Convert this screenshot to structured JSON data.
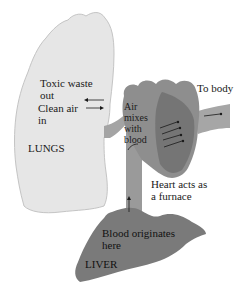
{
  "diagram": {
    "organs": {
      "lungs": {
        "label": "LUNGS",
        "fill": "#e6e6e6",
        "stroke": "#bdbdbd"
      },
      "heart": {
        "fill": "#8e8e8e",
        "shade": "#6f6f6f"
      },
      "liver": {
        "label": "LIVER",
        "fill": "#7a7a7a"
      },
      "vessels": {
        "fill": "#9a9a9a"
      }
    },
    "labels": {
      "toxic_waste": "Toxic waste\nout",
      "clean_air": "Clean air\nin",
      "air_mixes": "Air\nmixes\nwith\nblood",
      "to_body": "To body",
      "heart_furnace": "Heart acts as\na furnace",
      "blood_originates": "Blood originates\nhere"
    },
    "colors": {
      "background": "#ffffff",
      "text": "#1a1a1a",
      "arrow": "#1a1a1a"
    }
  }
}
